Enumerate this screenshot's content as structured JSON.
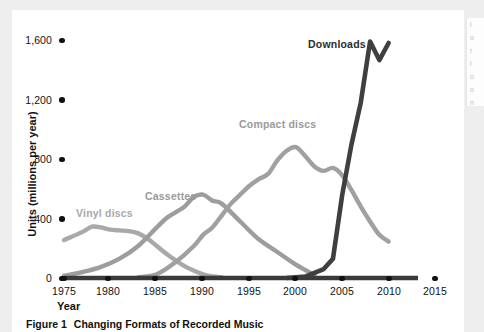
{
  "figure": {
    "caption_number": "Figure 1",
    "caption_text": "Changing Formats of Recorded Music"
  },
  "right_sliver": {
    "lines": [
      "l",
      "o",
      "r",
      "l",
      "o",
      "o",
      "n"
    ]
  },
  "chart_data": {
    "type": "line",
    "title": "Changing Formats of Recorded Music",
    "xlabel": "Year",
    "ylabel": "Units (millions per year)",
    "xlim": [
      1975,
      2015
    ],
    "ylim": [
      0,
      1600
    ],
    "xticks": [
      "1975",
      "1980",
      "1985",
      "1990",
      "1995",
      "2000",
      "2005",
      "2010",
      "2015"
    ],
    "yticks": [
      "0",
      "400",
      "800",
      "1,200",
      "1,600"
    ],
    "grid": false,
    "legend_position": "inline-labels",
    "colors": {
      "vinyl": "#a9a9a9",
      "cassettes": "#9d9d9d",
      "compact": "#a0a0a0",
      "downloads": "#3f3f3f",
      "axis": "#3a3a3a",
      "tick": "#111111"
    },
    "series": [
      {
        "name": "Vinyl discs",
        "color": "#a9a9a9",
        "x": [
          1975,
          1977,
          1978,
          1979,
          1980,
          1981,
          1982,
          1983,
          1984,
          1985,
          1986,
          1987,
          1988,
          1989,
          1990,
          1991,
          1992
        ],
        "values": [
          255,
          310,
          345,
          340,
          325,
          320,
          315,
          300,
          265,
          215,
          165,
          120,
          80,
          50,
          25,
          10,
          5
        ]
      },
      {
        "name": "Cassettes",
        "color": "#9d9d9d",
        "x": [
          1975,
          1977,
          1979,
          1981,
          1983,
          1985,
          1986,
          1987,
          1988,
          1989,
          1990,
          1991,
          1992,
          1994,
          1996,
          1998,
          2000,
          2002
        ],
        "values": [
          15,
          40,
          75,
          130,
          215,
          340,
          400,
          440,
          480,
          545,
          560,
          520,
          500,
          380,
          260,
          175,
          90,
          20
        ]
      },
      {
        "name": "Compact discs",
        "color": "#a0a0a0",
        "x": [
          1983,
          1985,
          1987,
          1989,
          1990,
          1991,
          1992,
          1993,
          1994,
          1995,
          1996,
          1997,
          1998,
          1999,
          2000,
          2001,
          2002,
          2003,
          2004,
          2005,
          2006,
          2007,
          2008,
          2009,
          2010
        ],
        "values": [
          5,
          25,
          105,
          215,
          290,
          340,
          420,
          500,
          560,
          620,
          665,
          700,
          790,
          855,
          880,
          820,
          750,
          720,
          740,
          690,
          590,
          480,
          380,
          290,
          245
        ]
      },
      {
        "name": "Downloads",
        "color": "#3f3f3f",
        "x": [
          1999,
          2001,
          2003,
          2004,
          2005,
          2006,
          2007,
          2008,
          2009,
          2010
        ],
        "values": [
          0,
          10,
          60,
          130,
          560,
          900,
          1180,
          1590,
          1465,
          1580
        ]
      }
    ],
    "annotations": [
      {
        "text": "Vinyl discs",
        "x": 1977,
        "y": 420
      },
      {
        "text": "Cassettes",
        "x": 1986,
        "y": 540
      },
      {
        "text": "Compact discs",
        "x": 1996,
        "y": 1030
      },
      {
        "text": "Downloads",
        "x": 2004,
        "y": 1560
      }
    ]
  }
}
